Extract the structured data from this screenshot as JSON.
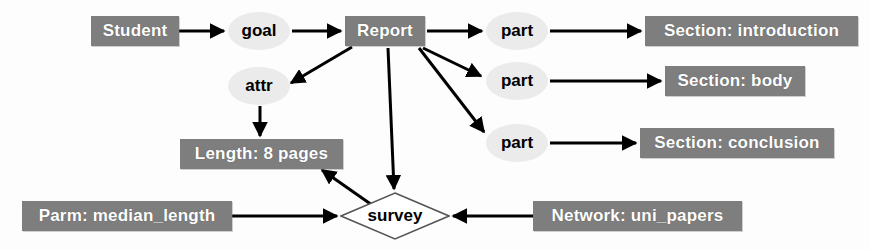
{
  "diagram": {
    "background_color": "#fdfdfd",
    "entity_fill": "#7e7e7e",
    "entity_text_color": "#ffffff",
    "relation_fill": "#ebebeb",
    "relation_text_color": "#000000",
    "edge_color": "#000000",
    "nodes": [
      {
        "id": "student",
        "label": "Student",
        "shape": "rect",
        "x": 91,
        "y": 16,
        "w": 88,
        "h": 30
      },
      {
        "id": "goal",
        "label": "goal",
        "shape": "ellipse",
        "x": 228,
        "y": 12,
        "w": 62,
        "h": 38
      },
      {
        "id": "report",
        "label": "Report",
        "shape": "rect",
        "x": 345,
        "y": 16,
        "w": 80,
        "h": 30
      },
      {
        "id": "attr",
        "label": "attr",
        "shape": "ellipse",
        "x": 228,
        "y": 67,
        "w": 62,
        "h": 38
      },
      {
        "id": "part1",
        "label": "part",
        "shape": "ellipse",
        "x": 486,
        "y": 12,
        "w": 62,
        "h": 38
      },
      {
        "id": "part2",
        "label": "part",
        "shape": "ellipse",
        "x": 486,
        "y": 62,
        "w": 62,
        "h": 38
      },
      {
        "id": "part3",
        "label": "part",
        "shape": "ellipse",
        "x": 486,
        "y": 124,
        "w": 62,
        "h": 38
      },
      {
        "id": "intro",
        "label": "Section: introduction",
        "shape": "rect",
        "x": 645,
        "y": 16,
        "w": 213,
        "h": 30
      },
      {
        "id": "body",
        "label": "Section: body",
        "shape": "rect",
        "x": 665,
        "y": 66,
        "w": 140,
        "h": 30
      },
      {
        "id": "conclusion",
        "label": "Section: conclusion",
        "shape": "rect",
        "x": 640,
        "y": 128,
        "w": 194,
        "h": 30
      },
      {
        "id": "length",
        "label": "Length: 8 pages",
        "shape": "rect",
        "x": 180,
        "y": 139,
        "w": 163,
        "h": 30
      },
      {
        "id": "parm",
        "label": "Parm: median_length",
        "shape": "rect",
        "x": 22,
        "y": 201,
        "w": 210,
        "h": 30
      },
      {
        "id": "survey",
        "label": "survey",
        "shape": "diamond",
        "x": 340,
        "y": 192,
        "w": 110,
        "h": 48
      },
      {
        "id": "network",
        "label": "Network: uni_papers",
        "shape": "rect",
        "x": 533,
        "y": 201,
        "w": 209,
        "h": 30
      }
    ],
    "edges": [
      {
        "from": "student",
        "to": "goal",
        "x1": 179,
        "y1": 31,
        "x2": 224,
        "y2": 31
      },
      {
        "from": "goal",
        "to": "report",
        "x1": 292,
        "y1": 31,
        "x2": 341,
        "y2": 31
      },
      {
        "from": "report",
        "to": "attr",
        "x1": 352,
        "y1": 47,
        "x2": 291,
        "y2": 83
      },
      {
        "from": "attr",
        "to": "length",
        "x1": 260,
        "y1": 106,
        "x2": 260,
        "y2": 136
      },
      {
        "from": "report",
        "to": "part1",
        "x1": 427,
        "y1": 31,
        "x2": 482,
        "y2": 31
      },
      {
        "from": "report",
        "to": "part2",
        "x1": 423,
        "y1": 48,
        "x2": 481,
        "y2": 76
      },
      {
        "from": "report",
        "to": "part3",
        "x1": 419,
        "y1": 48,
        "x2": 484,
        "y2": 132
      },
      {
        "from": "part1",
        "to": "intro",
        "x1": 550,
        "y1": 31,
        "x2": 641,
        "y2": 31
      },
      {
        "from": "part2",
        "to": "body",
        "x1": 550,
        "y1": 81,
        "x2": 661,
        "y2": 81
      },
      {
        "from": "part3",
        "to": "conclusion",
        "x1": 550,
        "y1": 143,
        "x2": 636,
        "y2": 143
      },
      {
        "from": "report",
        "to": "survey",
        "x1": 388,
        "y1": 48,
        "x2": 394,
        "y2": 189
      },
      {
        "from": "survey",
        "to": "length",
        "x1": 372,
        "y1": 205,
        "x2": 322,
        "y2": 170
      },
      {
        "from": "parm",
        "to": "survey",
        "x1": 232,
        "y1": 216,
        "x2": 337,
        "y2": 216
      },
      {
        "from": "network",
        "to": "survey",
        "x1": 533,
        "y1": 216,
        "x2": 453,
        "y2": 216
      }
    ]
  }
}
